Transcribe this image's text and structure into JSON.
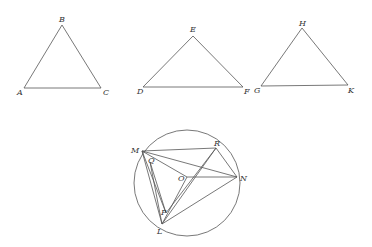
{
  "diagram": {
    "stroke_color": "#555555",
    "label_color": "#333333",
    "background": "#ffffff",
    "triangles": [
      {
        "name": "ABC",
        "vertices": [
          {
            "label": "A",
            "x": 24,
            "y": 88,
            "lx": 17,
            "ly": 95
          },
          {
            "label": "B",
            "x": 62,
            "y": 25,
            "lx": 59,
            "ly": 22
          },
          {
            "label": "C",
            "x": 101,
            "y": 88,
            "lx": 103,
            "ly": 95
          }
        ]
      },
      {
        "name": "DEF",
        "vertices": [
          {
            "label": "D",
            "x": 143,
            "y": 87,
            "lx": 137,
            "ly": 94
          },
          {
            "label": "E",
            "x": 193,
            "y": 36,
            "lx": 190,
            "ly": 32
          },
          {
            "label": "F",
            "x": 243,
            "y": 87,
            "lx": 244,
            "ly": 94
          }
        ]
      },
      {
        "name": "GHK",
        "vertices": [
          {
            "label": "G",
            "x": 261,
            "y": 86,
            "lx": 254,
            "ly": 93
          },
          {
            "label": "H",
            "x": 302,
            "y": 28,
            "lx": 299,
            "ly": 26
          },
          {
            "label": "K",
            "x": 348,
            "y": 85,
            "lx": 348,
            "ly": 93
          }
        ]
      }
    ],
    "circle": {
      "center": {
        "x": 187,
        "y": 183
      },
      "radius": 53,
      "points": [
        {
          "label": "M",
          "x": 142,
          "y": 151,
          "lx": 131,
          "ly": 153
        },
        {
          "label": "R",
          "x": 216,
          "y": 148,
          "lx": 214,
          "ly": 146
        },
        {
          "label": "N",
          "x": 237,
          "y": 177,
          "lx": 240,
          "ly": 181
        },
        {
          "label": "O",
          "x": 187,
          "y": 177,
          "lx": 178,
          "ly": 181
        },
        {
          "label": "Q",
          "x": 150,
          "y": 162,
          "lx": 148,
          "ly": 163
        },
        {
          "label": "P",
          "x": 166,
          "y": 213,
          "lx": 161,
          "ly": 215
        },
        {
          "label": "L",
          "x": 162,
          "y": 224,
          "lx": 157,
          "ly": 234
        }
      ],
      "segments": [
        [
          "M",
          "R"
        ],
        [
          "M",
          "N"
        ],
        [
          "M",
          "O"
        ],
        [
          "M",
          "L"
        ],
        [
          "M",
          "P"
        ],
        [
          "R",
          "N"
        ],
        [
          "R",
          "L"
        ],
        [
          "R",
          "P"
        ],
        [
          "O",
          "N"
        ],
        [
          "O",
          "L"
        ],
        [
          "L",
          "N"
        ],
        [
          "Q",
          "P"
        ],
        [
          "Q",
          "L"
        ]
      ]
    }
  }
}
